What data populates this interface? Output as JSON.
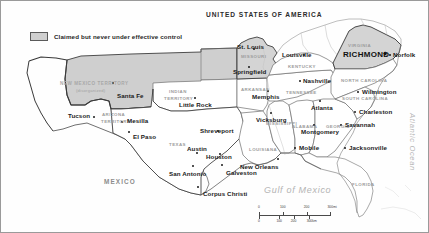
{
  "map": {
    "title_country_us": "UNITED STATES OF AMERICA",
    "title_country_mx": "MEXICO",
    "legend": {
      "label": "Claimed but never under effective control",
      "swatch_color": "#cfcfcf",
      "swatch_border": "#5a5a5a"
    },
    "capital": {
      "name": "RICHMOND",
      "marker": "★"
    },
    "water_bodies": [
      {
        "name": "Gulf of Mexico"
      },
      {
        "name": "Atlantic Ocean"
      }
    ],
    "territories": [
      {
        "name": "NEW MEXICO TERRITORY",
        "sub": "(disorganized)"
      },
      {
        "name": "ARIZONA",
        "sub": "TERRITORY"
      },
      {
        "name": "INDIAN",
        "sub": "TERRITORY"
      }
    ],
    "states": [
      {
        "name": "MISSOURI"
      },
      {
        "name": "ARKANSAS"
      },
      {
        "name": "TEXAS"
      },
      {
        "name": "LOUISIANA"
      },
      {
        "name": "MISSISSIPPI"
      },
      {
        "name": "ALABAMA"
      },
      {
        "name": "GEORGIA"
      },
      {
        "name": "FLORIDA"
      },
      {
        "name": "TENNESSEE"
      },
      {
        "name": "KENTUCKY"
      },
      {
        "name": "VIRGINIA"
      },
      {
        "name": "NORTH CAROLINA"
      },
      {
        "name": "SOUTH CAROLINA"
      }
    ],
    "cities": [
      {
        "name": "St. Louis"
      },
      {
        "name": "Springfield"
      },
      {
        "name": "Louisville"
      },
      {
        "name": "Norfolk"
      },
      {
        "name": "Nashville"
      },
      {
        "name": "Memphis"
      },
      {
        "name": "Little Rock"
      },
      {
        "name": "Wilmington"
      },
      {
        "name": "Charleston"
      },
      {
        "name": "Atlanta"
      },
      {
        "name": "Savannah"
      },
      {
        "name": "Vicksburg"
      },
      {
        "name": "Montgomery"
      },
      {
        "name": "Jacksonville"
      },
      {
        "name": "Shreveport"
      },
      {
        "name": "Mobile"
      },
      {
        "name": "Austin"
      },
      {
        "name": "Houston"
      },
      {
        "name": "New Orleans"
      },
      {
        "name": "San Antonio"
      },
      {
        "name": "Galveston"
      },
      {
        "name": "Corpus Christi"
      },
      {
        "name": "Santa Fe"
      },
      {
        "name": "Tucson"
      },
      {
        "name": "Mesilla"
      },
      {
        "name": "El Paso"
      }
    ],
    "scale": {
      "miles": {
        "ticks": [
          "0",
          "100",
          "200",
          "300"
        ],
        "unit": "mi"
      },
      "km": {
        "ticks": [
          "0",
          "100",
          "200",
          "300"
        ],
        "unit": "km"
      }
    },
    "colors": {
      "claimed_fill": "#cfcfcf",
      "land_fill": "#ffffff",
      "border_stroke": "#4a4a4a",
      "state_label": "#a8a8a8",
      "water_label": "#b4b4b4"
    }
  }
}
